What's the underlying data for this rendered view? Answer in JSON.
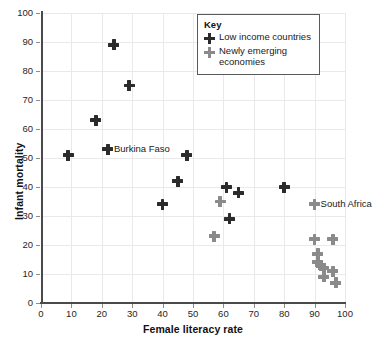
{
  "chart_data": {
    "type": "scatter",
    "title": "",
    "xlabel": "Female literacy rate",
    "ylabel": "Infant mortality",
    "xlim": [
      0,
      100
    ],
    "ylim": [
      0,
      100
    ],
    "xticks": [
      0,
      10,
      20,
      30,
      40,
      50,
      60,
      70,
      80,
      90,
      100
    ],
    "yticks": [
      0,
      10,
      20,
      30,
      40,
      50,
      60,
      70,
      80,
      90,
      100
    ],
    "grid": true,
    "legend": {
      "title": "Key",
      "position": "top-right",
      "entries": [
        {
          "name": "Low income countries",
          "color": "#2b2b2b",
          "marker": "plus"
        },
        {
          "name": "Newly emerging economies",
          "color": "#8a8a8a",
          "marker": "plus"
        }
      ]
    },
    "series": [
      {
        "name": "Low income countries",
        "color": "#2b2b2b",
        "points": [
          {
            "x": 9,
            "y": 51
          },
          {
            "x": 18,
            "y": 63
          },
          {
            "x": 22,
            "y": 53,
            "label": "Burkina Faso"
          },
          {
            "x": 24,
            "y": 89
          },
          {
            "x": 29,
            "y": 75
          },
          {
            "x": 40,
            "y": 34
          },
          {
            "x": 45,
            "y": 42
          },
          {
            "x": 48,
            "y": 51
          },
          {
            "x": 61,
            "y": 40
          },
          {
            "x": 62,
            "y": 29
          },
          {
            "x": 65,
            "y": 38
          },
          {
            "x": 80,
            "y": 40
          }
        ]
      },
      {
        "name": "Newly emerging economies",
        "color": "#8a8a8a",
        "points": [
          {
            "x": 57,
            "y": 23
          },
          {
            "x": 59,
            "y": 35
          },
          {
            "x": 90,
            "y": 34,
            "label": "South Africa"
          },
          {
            "x": 90,
            "y": 22
          },
          {
            "x": 96,
            "y": 22
          },
          {
            "x": 91,
            "y": 17
          },
          {
            "x": 91,
            "y": 14
          },
          {
            "x": 92,
            "y": 13
          },
          {
            "x": 93,
            "y": 12
          },
          {
            "x": 93,
            "y": 9
          },
          {
            "x": 96,
            "y": 11
          },
          {
            "x": 97,
            "y": 7
          }
        ]
      }
    ],
    "annotations": [
      {
        "text": "Burkina Faso",
        "x": 22,
        "y": 53
      },
      {
        "text": "South Africa",
        "x": 90,
        "y": 34
      }
    ]
  },
  "axis": {
    "x_title": "Female literacy rate",
    "y_title": "Infant mortality"
  },
  "legend": {
    "title": "Key",
    "items": [
      {
        "label": "Low income countries"
      },
      {
        "label": "Newly emerging economies"
      }
    ]
  }
}
